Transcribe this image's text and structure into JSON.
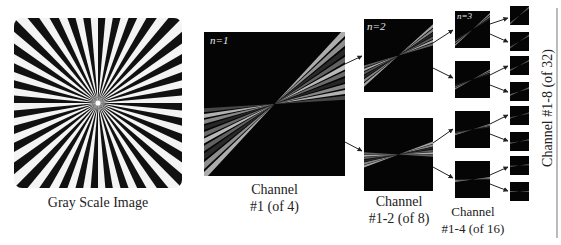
{
  "figure": {
    "input": {
      "label": "Gray Scale Image"
    },
    "levels": [
      {
        "n_label": "n=1",
        "caption_line1": "Channel",
        "caption_line2": "#1 (of 4)"
      },
      {
        "n_label": "n=2",
        "caption_line1": "Channel",
        "caption_line2": "#1-2 (of 8)"
      },
      {
        "n_label": "n=3",
        "caption_line1": "Channel",
        "caption_line2": "#1-4 (of 16)"
      },
      {
        "n_label": "",
        "caption_rotated": "Channel #1-8 (of 32)"
      }
    ]
  }
}
